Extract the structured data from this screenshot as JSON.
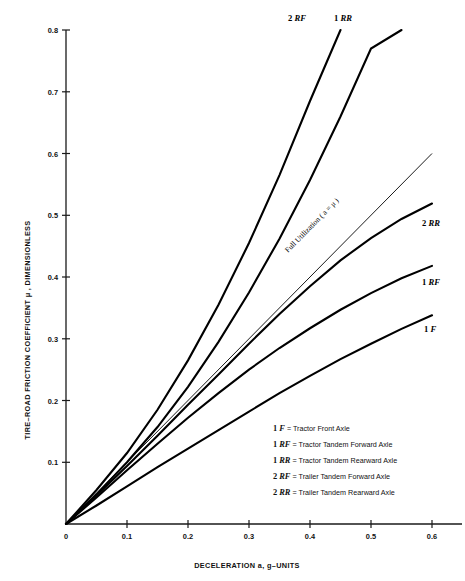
{
  "figure": {
    "background": "#ffffff",
    "ink": "#000000"
  },
  "axes": {
    "x_title": "DECELERATION a, g–UNITS",
    "y_title": "TIRE–ROAD FRICTION COEFFICIENT μ , DIMENSIONLESS",
    "x_ticks": [
      "0",
      "0.1",
      "0.2",
      "0.3",
      "0.4",
      "0.5",
      "0.6"
    ],
    "y_ticks": [
      "0.1",
      "0.2",
      "0.3",
      "0.4",
      "0.5",
      "0.6",
      "0.7",
      "0.8"
    ]
  },
  "annotations": {
    "full_utilization": "Full Utilization ( a = μ )",
    "curve_labels": {
      "c2rf": {
        "num": "2",
        "code": "RF"
      },
      "c1rr": {
        "num": "1",
        "code": "RR"
      },
      "c2rr": {
        "num": "2",
        "code": "RR"
      },
      "c1rf": {
        "num": "1",
        "code": "RF"
      },
      "c1f": {
        "num": "1",
        "code": "F"
      }
    }
  },
  "legend": {
    "items": [
      {
        "num": "1",
        "code": "F",
        "text": "= Tractor Front Axle"
      },
      {
        "num": "1",
        "code": "RF",
        "text": "= Tractor Tandem Forward Axle"
      },
      {
        "num": "1",
        "code": "RR",
        "text": "= Tractor Tandem Rearward Axle"
      },
      {
        "num": "2",
        "code": "RF",
        "text": "= Trailer Tandem Forward Axle"
      },
      {
        "num": "2",
        "code": "RR",
        "text": "= Trailer Tandem Rearward Axle"
      }
    ]
  },
  "chart_data": {
    "type": "line",
    "title": "",
    "xlabel": "DECELERATION a, g–UNITS",
    "ylabel": "TIRE–ROAD FRICTION COEFFICIENT μ , DIMENSIONLESS",
    "xlim": [
      0,
      0.63
    ],
    "ylim": [
      0,
      0.8
    ],
    "grid": false,
    "legend_position": "inside-lower-right",
    "x": [
      0,
      0.05,
      0.1,
      0.15,
      0.2,
      0.25,
      0.3,
      0.35,
      0.4,
      0.45,
      0.5,
      0.55,
      0.6
    ],
    "series": [
      {
        "name": "2 RF",
        "label": "2 RF = Trailer Tandem Forward Axle",
        "values": [
          0,
          0.055,
          0.115,
          0.185,
          0.265,
          0.355,
          0.455,
          0.565,
          0.685,
          0.8,
          null,
          null,
          null
        ]
      },
      {
        "name": "1 RR",
        "label": "1 RR = Tractor Tandem Rearward Axle",
        "values": [
          0,
          0.048,
          0.1,
          0.157,
          0.222,
          0.295,
          0.375,
          0.462,
          0.557,
          0.66,
          0.77,
          0.8,
          null
        ]
      },
      {
        "name": "Full Utilization (a = μ)",
        "label": "Full Utilization ( a = μ )",
        "values": [
          0,
          0.05,
          0.1,
          0.15,
          0.2,
          0.25,
          0.3,
          0.35,
          0.4,
          0.45,
          0.5,
          0.55,
          0.6
        ],
        "style": "thin"
      },
      {
        "name": "2 RR",
        "label": "2 RR = Trailer Tandem Rearward Axle",
        "values": [
          0,
          0.046,
          0.094,
          0.143,
          0.193,
          0.242,
          0.292,
          0.34,
          0.385,
          0.427,
          0.463,
          0.494,
          0.519
        ]
      },
      {
        "name": "1 RF",
        "label": "1 RF = Tractor Tandem Forward Axle",
        "values": [
          0,
          0.043,
          0.087,
          0.13,
          0.172,
          0.212,
          0.25,
          0.285,
          0.317,
          0.347,
          0.374,
          0.398,
          0.418
        ]
      },
      {
        "name": "1 F",
        "label": "1 F = Tractor Front Axle",
        "values": [
          0,
          0.03,
          0.061,
          0.092,
          0.122,
          0.152,
          0.182,
          0.212,
          0.24,
          0.267,
          0.292,
          0.316,
          0.338
        ]
      }
    ]
  }
}
